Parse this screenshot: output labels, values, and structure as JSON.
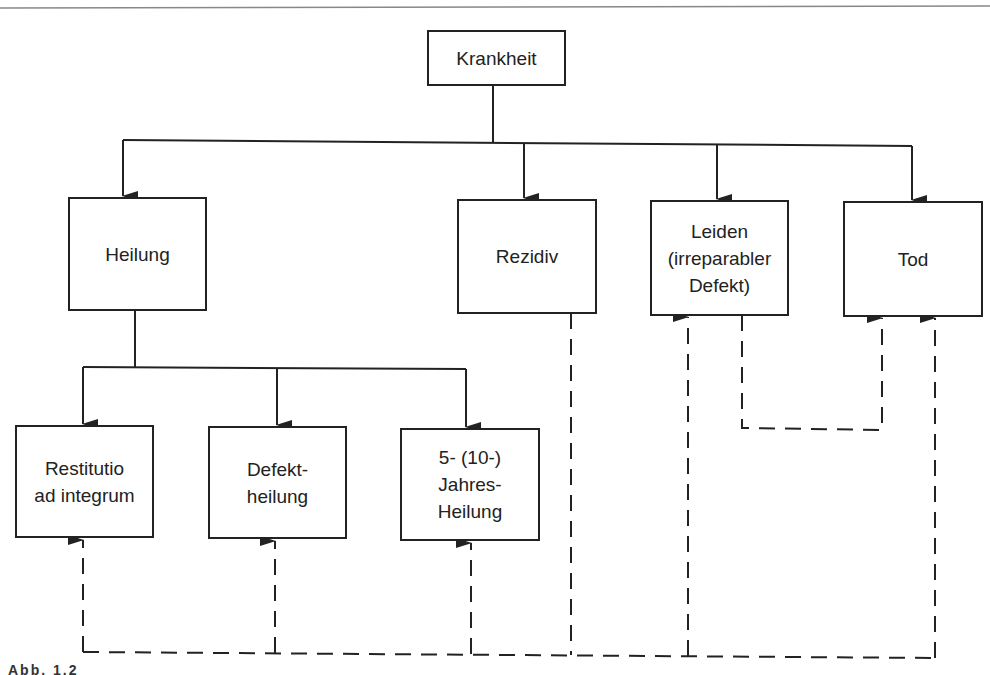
{
  "diagram": {
    "root": {
      "label": "Krankheit"
    },
    "outcomes": [
      {
        "id": "heilung",
        "label": "Heilung"
      },
      {
        "id": "rezidiv",
        "label": "Rezidiv"
      },
      {
        "id": "leiden",
        "lines": [
          "Leiden",
          "(irreparabler",
          "Defekt)"
        ]
      },
      {
        "id": "tod",
        "label": "Tod"
      }
    ],
    "healing_types": [
      {
        "id": "restitutio",
        "lines": [
          "Restitutio",
          "ad integrum"
        ]
      },
      {
        "id": "defektheilung",
        "lines": [
          "Defekt-",
          "heilung"
        ]
      },
      {
        "id": "jahresheilung",
        "lines": [
          "5- (10-)",
          "Jahres-",
          "Heilung"
        ]
      }
    ],
    "edges_solid": [
      [
        "Krankheit",
        "Heilung"
      ],
      [
        "Krankheit",
        "Rezidiv"
      ],
      [
        "Krankheit",
        "Leiden"
      ],
      [
        "Krankheit",
        "Tod"
      ],
      [
        "Heilung",
        "Restitutio ad integrum"
      ],
      [
        "Heilung",
        "Defektheilung"
      ],
      [
        "Heilung",
        "5- (10-) Jahres-Heilung"
      ]
    ],
    "edges_dashed": [
      [
        "Rezidiv",
        "Restitutio ad integrum"
      ],
      [
        "Rezidiv",
        "Defektheilung"
      ],
      [
        "Rezidiv",
        "5- (10-) Jahres-Heilung"
      ],
      [
        "Rezidiv",
        "Leiden"
      ],
      [
        "Rezidiv",
        "Tod"
      ],
      [
        "Leiden",
        "Tod"
      ]
    ],
    "caption": "Abb. 1.2"
  },
  "colors": {
    "line": "#222222",
    "background": "#ffffff"
  }
}
